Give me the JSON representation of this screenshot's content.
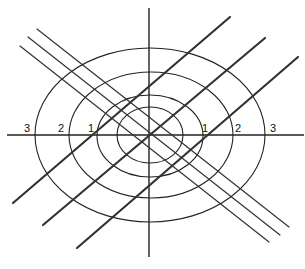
{
  "diagram": {
    "center": [
      150,
      135
    ],
    "axes": {
      "horizontal": {
        "x1": 7,
        "y1": 135,
        "x2": 304,
        "y2": 135
      },
      "vertical": {
        "x1": 149,
        "y1": 8,
        "x2": 149,
        "y2": 257
      }
    },
    "ellipses": [
      {
        "name": "outer",
        "cx": 150,
        "cy": 135,
        "rx": 115,
        "ry": 87
      },
      {
        "name": "second",
        "cx": 151,
        "cy": 135,
        "rx": 82,
        "ry": 63
      },
      {
        "name": "third",
        "cx": 150,
        "cy": 136,
        "rx": 53,
        "ry": 41
      },
      {
        "name": "inner",
        "cx": 150,
        "cy": 135,
        "rx": 33,
        "ry": 28
      }
    ],
    "thick_lines": [
      {
        "x1": 13,
        "y1": 203,
        "x2": 230,
        "y2": 17
      },
      {
        "x1": 43,
        "y1": 225,
        "x2": 265,
        "y2": 38
      },
      {
        "x1": 77,
        "y1": 248,
        "x2": 298,
        "y2": 57
      }
    ],
    "thin_lines": [
      {
        "x1": 37,
        "y1": 29,
        "x2": 289,
        "y2": 227
      },
      {
        "x1": 28,
        "y1": 37,
        "x2": 280,
        "y2": 235
      },
      {
        "x1": 20,
        "y1": 46,
        "x2": 269,
        "y2": 242
      }
    ],
    "labels": {
      "left": [
        {
          "text": "3",
          "x": 24,
          "y": 132
        },
        {
          "text": "2",
          "x": 58,
          "y": 132
        },
        {
          "text": "1",
          "x": 88,
          "y": 132
        }
      ],
      "right": [
        {
          "text": "1",
          "x": 202,
          "y": 132
        },
        {
          "text": "2",
          "x": 235,
          "y": 132
        },
        {
          "text": "3",
          "x": 270,
          "y": 132
        }
      ]
    }
  }
}
